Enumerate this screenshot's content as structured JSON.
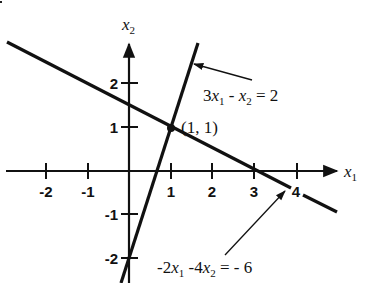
{
  "diagram": {
    "type": "cartesian-plane-two-lines",
    "axes": {
      "x_label": "x",
      "x_label_sub": "1",
      "y_label": "x",
      "y_label_sub": "2",
      "x_ticks": [
        {
          "value": -2,
          "label": "-2"
        },
        {
          "value": -1,
          "label": "-1"
        },
        {
          "value": 1,
          "label": "1"
        },
        {
          "value": 2,
          "label": "2"
        },
        {
          "value": 3,
          "label": "3"
        },
        {
          "value": 4,
          "label": "4"
        }
      ],
      "y_ticks": [
        {
          "value": 2,
          "label": "2"
        },
        {
          "value": 1,
          "label": "1"
        },
        {
          "value": -1,
          "label": "-1"
        },
        {
          "value": -2,
          "label": "-2"
        }
      ]
    },
    "lines": [
      {
        "name": "line-1",
        "equation_parts": {
          "c1": "3",
          "v1": "x",
          "s1": "1",
          "op": " - ",
          "v2": "x",
          "s2": "2",
          "rhs": " = 2"
        },
        "equation": "3x1 - x2 = 2"
      },
      {
        "name": "line-2",
        "equation_parts": {
          "c1": "-2",
          "v1": "x",
          "s1": "1",
          "op": " -4",
          "v2": "x",
          "s2": "2",
          "rhs": " = - 6"
        },
        "equation": "-2x1 -4x2 = -6"
      }
    ],
    "intersection": {
      "label": "(1, 1)",
      "x": 1,
      "y": 1
    },
    "color": "#111111"
  }
}
